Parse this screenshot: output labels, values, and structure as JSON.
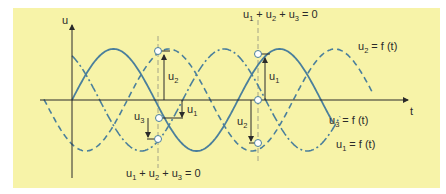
{
  "diagram": {
    "axes": {
      "y_label": "u",
      "x_label": "t"
    },
    "colors": {
      "background": "#f7f3a8",
      "curve": "#4a7f9c",
      "axis": "#333333",
      "guide": "#9a9a8a"
    },
    "curves": [
      {
        "name": "u1",
        "label_base": "u",
        "label_sub": "1",
        "label_rest": " = f (t)",
        "style": "solid",
        "phase_deg": 0
      },
      {
        "name": "u2",
        "label_base": "u",
        "label_sub": "2",
        "label_rest": " = f (t)",
        "style": "dashed",
        "phase_deg": -120
      },
      {
        "name": "u3",
        "label_base": "u",
        "label_sub": "3",
        "label_rest": " = f (t)",
        "style": "dash-dot",
        "phase_deg": 120
      }
    ],
    "annotations": {
      "sum_top": {
        "parts": [
          "u",
          "1",
          " + u",
          "2",
          " + u",
          "3",
          " = 0"
        ]
      },
      "sum_bottom": {
        "parts": [
          "u",
          "1",
          " + u",
          "2",
          " + u",
          "3",
          " = 0"
        ]
      },
      "left_marker": {
        "arrows": [
          {
            "base": "u",
            "sub": "2"
          },
          {
            "base": "u",
            "sub": "1"
          },
          {
            "base": "u",
            "sub": "3"
          }
        ]
      },
      "right_marker": {
        "arrows": [
          {
            "base": "u",
            "sub": "1"
          },
          {
            "base": "u",
            "sub": "2"
          }
        ]
      }
    }
  }
}
